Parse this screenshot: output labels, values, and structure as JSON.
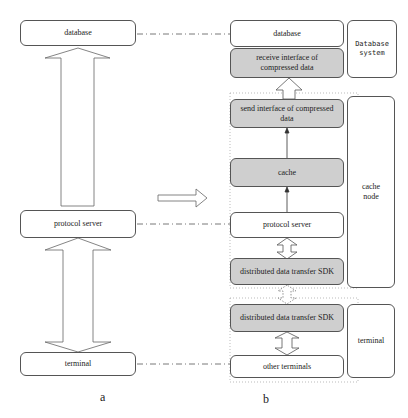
{
  "panel_a": {
    "caption": "a",
    "database": "database",
    "protocol_server": "protocol server",
    "terminal": "terminal"
  },
  "panel_b": {
    "caption": "b",
    "database": "database",
    "receive_interface": "receive interface of compressed data",
    "send_interface": "send interface of compressed data",
    "cache": "cache",
    "protocol_server": "protocol server",
    "sdk_server": "distributed data transfer SDK",
    "sdk_terminal": "distributed data transfer SDK",
    "other_terminals": "other terminals",
    "groups": {
      "database_system": "Database system",
      "cache_node": "cache node",
      "terminal": "terminal"
    }
  },
  "colors": {
    "gray_fill": "#cfcfcf",
    "border": "#555555"
  }
}
